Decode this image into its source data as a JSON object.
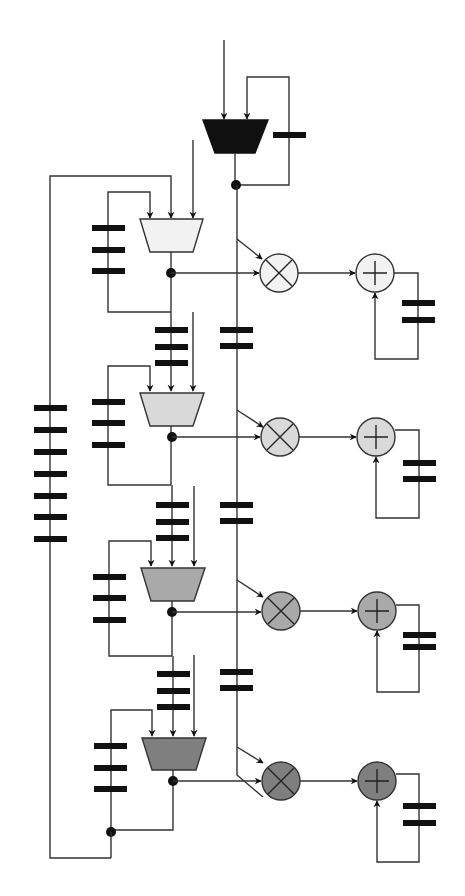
{
  "diagram": {
    "title": "",
    "colors": {
      "wire": "#333333",
      "register": "#111111",
      "top_mux": "#111111",
      "stage_fills": [
        "#f2f2f2",
        "#d9d9d9",
        "#a9a9a9",
        "#7f7f7f"
      ]
    },
    "top_mux": {
      "label": "",
      "inputs": 2,
      "feedback_registers": 1
    },
    "stages": [
      {
        "id": 1,
        "mux_inputs": 3,
        "feedback_registers": 3,
        "input_registers": 0,
        "line_registers": 2,
        "multiplier": "×",
        "adder": "+",
        "acc_registers": 2
      },
      {
        "id": 2,
        "mux_inputs": 3,
        "feedback_registers": 3,
        "input_registers": 3,
        "line_registers": 2,
        "multiplier": "×",
        "adder": "+",
        "acc_registers": 2
      },
      {
        "id": 3,
        "mux_inputs": 3,
        "feedback_registers": 3,
        "input_registers": 3,
        "line_registers": 2,
        "multiplier": "×",
        "adder": "+",
        "acc_registers": 2
      },
      {
        "id": 4,
        "mux_inputs": 3,
        "feedback_registers": 3,
        "input_registers": 3,
        "line_registers": 0,
        "multiplier": "×",
        "adder": "+",
        "acc_registers": 2
      }
    ],
    "outer_loop_registers": 7
  }
}
